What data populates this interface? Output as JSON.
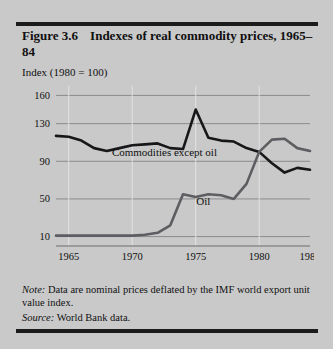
{
  "figure": {
    "number": "Figure 3.6",
    "title": "Indexes of real commodity prices, 1965–84",
    "axis_note": "Index (1980 = 100)",
    "note_label": "Note:",
    "note_body": "Data are nominal prices deflated by the IMF world export unit value index.",
    "source_label": "Source:",
    "source_body": "World Bank data."
  },
  "chart_data": {
    "type": "line",
    "title": "Indexes of real commodity prices, 1965–84",
    "xlabel": "",
    "ylabel": "Index (1980 = 100)",
    "xlim": [
      1964,
      1984
    ],
    "ylim": [
      0,
      170
    ],
    "yticks": [
      10,
      50,
      90,
      130,
      160
    ],
    "ytick_labels": [
      "10",
      "50",
      "90",
      "130",
      "160"
    ],
    "xticks": [
      1965,
      1970,
      1975,
      1980,
      1984
    ],
    "xtick_labels": [
      "1965",
      "1970",
      "1975",
      "1980",
      "1984"
    ],
    "grid": "horizontal-and-vertical",
    "legend": "inline-annotations",
    "x": [
      1964,
      1965,
      1966,
      1967,
      1968,
      1969,
      1970,
      1971,
      1972,
      1973,
      1974,
      1975,
      1976,
      1977,
      1978,
      1979,
      1980,
      1981,
      1982,
      1983,
      1984
    ],
    "series": [
      {
        "name": "Commodities except oil",
        "color": "#17171a",
        "label_x": 1968.4,
        "label_y": 96,
        "values": [
          117,
          116,
          112,
          104,
          101,
          104,
          107,
          108,
          109,
          104,
          103,
          145,
          115,
          112,
          111,
          104,
          100,
          88,
          78,
          83,
          81
        ]
      },
      {
        "name": "Oil",
        "color": "#5e5e62",
        "label_x": 1975.6,
        "label_y": 44,
        "values": [
          11,
          11,
          11,
          11,
          11,
          11,
          11,
          12,
          14,
          22,
          55,
          52,
          55,
          54,
          50,
          66,
          100,
          113,
          114,
          104,
          101
        ]
      }
    ]
  }
}
